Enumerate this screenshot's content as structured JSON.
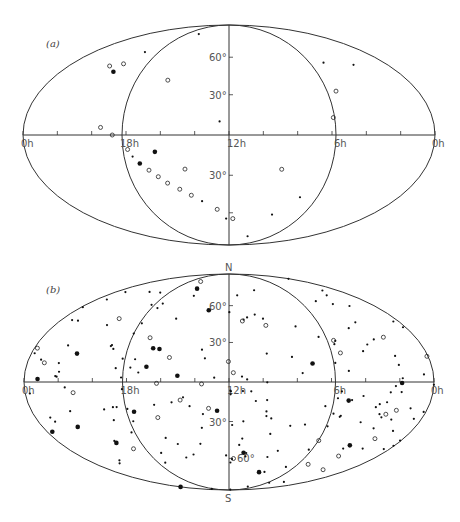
{
  "figure": {
    "panels": [
      {
        "id": "a",
        "label": "(a)"
      },
      {
        "id": "b",
        "label": "(b)"
      }
    ]
  },
  "chart_data": [
    {
      "type": "scatter",
      "title": "(a)",
      "projection": "Aitoff equal-area all-sky, celestial coordinates",
      "x_ticks": [
        "0h",
        "18h",
        "12h",
        "6h",
        "0h"
      ],
      "y_ticks": [
        "60°",
        "30°",
        "30°"
      ],
      "pole_labels": [],
      "marker_types": [
        "filled dot (small)",
        "filled dot (large)",
        "open circle"
      ],
      "points_desc": "Sources concentrated along a band from ~18h,0° curving south toward 12h,-75°; sparse elsewhere",
      "points": [
        {
          "ra": 18.3,
          "dec": 0,
          "m": "o"
        },
        {
          "ra": 17.5,
          "dec": -10,
          "m": "o"
        },
        {
          "ra": 17.3,
          "dec": -15,
          "m": "f"
        },
        {
          "ra": 17.0,
          "dec": -20,
          "m": "F"
        },
        {
          "ra": 16.6,
          "dec": -25,
          "m": "o"
        },
        {
          "ra": 16.2,
          "dec": -30,
          "m": "o"
        },
        {
          "ra": 15.8,
          "dec": -35,
          "m": "o"
        },
        {
          "ra": 15.2,
          "dec": -40,
          "m": "o"
        },
        {
          "ra": 14.6,
          "dec": -45,
          "m": "o"
        },
        {
          "ra": 14.0,
          "dec": -50,
          "m": "f"
        },
        {
          "ra": 13.0,
          "dec": -57,
          "m": "o"
        },
        {
          "ra": 12.3,
          "dec": -65,
          "m": "f"
        },
        {
          "ra": 11.6,
          "dec": -65,
          "m": "o"
        },
        {
          "ra": 16.0,
          "dec": -12,
          "m": "F"
        },
        {
          "ra": 14.5,
          "dec": -25,
          "m": "o"
        },
        {
          "ra": 21.0,
          "dec": 45,
          "m": "o"
        },
        {
          "ra": 20.2,
          "dec": 48,
          "m": "o"
        },
        {
          "ra": 20.2,
          "dec": 42,
          "m": "F"
        },
        {
          "ra": 20.0,
          "dec": 58,
          "m": "f"
        },
        {
          "ra": 18.5,
          "dec": 78,
          "m": "f"
        },
        {
          "ra": 16.0,
          "dec": 40,
          "m": "o"
        },
        {
          "ra": 12.5,
          "dec": 10,
          "m": "f"
        },
        {
          "ra": 19.0,
          "dec": 5,
          "m": "o"
        },
        {
          "ra": 4.5,
          "dec": 50,
          "m": "f"
        },
        {
          "ra": 2.5,
          "dec": 45,
          "m": "f"
        },
        {
          "ra": 5.5,
          "dec": 30,
          "m": "o"
        },
        {
          "ra": 6.3,
          "dec": 12,
          "m": "o"
        },
        {
          "ra": 9.0,
          "dec": -25,
          "m": "o"
        },
        {
          "ra": 7.0,
          "dec": -45,
          "m": "f"
        },
        {
          "ra": 8.0,
          "dec": -60,
          "m": "f"
        },
        {
          "ra": 7.5,
          "dec": -80,
          "m": "f"
        }
      ]
    },
    {
      "type": "scatter",
      "title": "(b)",
      "projection": "Aitoff equal-area all-sky, celestial coordinates",
      "x_ticks": [
        "0h",
        "18h",
        "12h",
        "6h",
        "0h"
      ],
      "y_ticks": [
        "60°",
        "30°",
        "30°",
        "60°"
      ],
      "pole_labels": [
        "N",
        "S"
      ],
      "marker_types": [
        "filled dot (small)",
        "filled dot (large)",
        "open circle"
      ],
      "points_desc": "Roughly isotropic distribution of ~200 sources across the whole sky",
      "points": []
    }
  ]
}
